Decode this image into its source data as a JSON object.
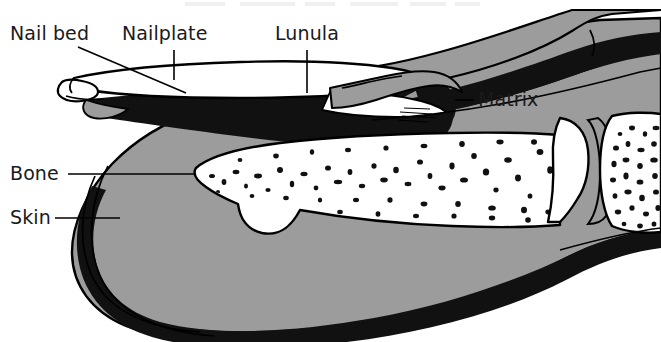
{
  "figure": {
    "view": "lateral sagittal section, distal finger pointing left",
    "style": "black and white line drawing with flat grey fill",
    "width": 661,
    "height": 342
  },
  "palette": {
    "background": "#ffffff",
    "outline": "#000000",
    "soft_tissue_grey": "#9c9c9c",
    "keratin_black": "#111111",
    "bone_white": "#ffffff",
    "nailplate_white": "#ffffff",
    "label_text": "#1a1a1a"
  },
  "labels": [
    {
      "id": "nail-bed",
      "text": "Nail bed",
      "x": 10,
      "y": 40,
      "anchor": "start",
      "leader": "diagonal",
      "leader_from": [
        78,
        47
      ],
      "leader_to": [
        185,
        92
      ],
      "description": "vascular tissue lying beneath the nail plate"
    },
    {
      "id": "nailplate",
      "text": "Nailplate",
      "x": 122,
      "y": 40,
      "anchor": "start",
      "leader": "vertical",
      "leader_from": [
        174,
        48
      ],
      "leader_to": [
        174,
        80
      ],
      "description": "hard keratin plate of the nail"
    },
    {
      "id": "lunula",
      "text": "Lunula",
      "x": 275,
      "y": 40,
      "anchor": "start",
      "leader": "vertical",
      "leader_from": [
        307,
        48
      ],
      "leader_to": [
        307,
        92
      ],
      "description": "pale crescent at the proximal nail plate"
    },
    {
      "id": "matrix",
      "text": "Matrix",
      "x": 478,
      "y": 106,
      "anchor": "start",
      "leader": "horizontal",
      "leader_from": [
        455,
        100
      ],
      "leader_to": [
        473,
        100
      ],
      "description": "germinal tissue that produces the nail plate"
    },
    {
      "id": "bone",
      "text": "Bone",
      "x": 10,
      "y": 180,
      "anchor": "start",
      "leader": "horizontal",
      "leader_from": [
        68,
        174
      ],
      "leader_to": [
        196,
        174
      ],
      "description": "distal phalanx with trabecular interior"
    },
    {
      "id": "skin",
      "text": "Skin",
      "x": 10,
      "y": 224,
      "anchor": "start",
      "leader": "horizontal",
      "leader_from": [
        55,
        218
      ],
      "leader_to": [
        120,
        218
      ],
      "description": "outer integument of the fingertip"
    }
  ],
  "structures": [
    {
      "id": "nail-plate",
      "name": "Nail plate",
      "fill": "#ffffff"
    },
    {
      "id": "free-edge",
      "name": "Free edge of nail",
      "fill": "#ffffff"
    },
    {
      "id": "nail-bed-layer",
      "name": "Nail bed",
      "fill": "#111111"
    },
    {
      "id": "matrix-wedge",
      "name": "Matrix",
      "fill": "#111111"
    },
    {
      "id": "proximal-fold",
      "name": "Proximal nail fold",
      "fill": "#9c9c9c"
    },
    {
      "id": "dermis",
      "name": "Dermis / pulp",
      "fill": "#9c9c9c"
    },
    {
      "id": "epidermis-band",
      "name": "Epidermis band",
      "fill": "#111111"
    },
    {
      "id": "distal-phalanx",
      "name": "Distal phalanx",
      "fill": "#ffffff"
    },
    {
      "id": "middle-phalanx",
      "name": "Middle phalanx",
      "fill": "#ffffff"
    },
    {
      "id": "joint-space",
      "name": "Interphalangeal joint space",
      "fill": "#9c9c9c"
    }
  ]
}
